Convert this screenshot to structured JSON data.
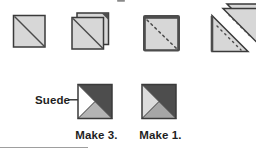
{
  "labels": {
    "suede_callout": "Suede",
    "make_three": "Make 3.",
    "make_one": "Make 1."
  },
  "colors": {
    "background": "#ffffff",
    "fabric_light": "#d7d7d7",
    "fabric_dark": "#4d4d4d",
    "fabric_white": "#ffffff",
    "fabric_pale": "#dcdcdc",
    "fabric_medium_make3": "#b4b4b4",
    "fabric_medium_make1": "#a6a6a6",
    "outline": "#3a3a3a",
    "stitch": "#4a4a4a",
    "arrow": "#1f1f1f",
    "text": "#1f1f1f",
    "rule": "#9e9e9e",
    "artifact": "#8a8a8a"
  }
}
